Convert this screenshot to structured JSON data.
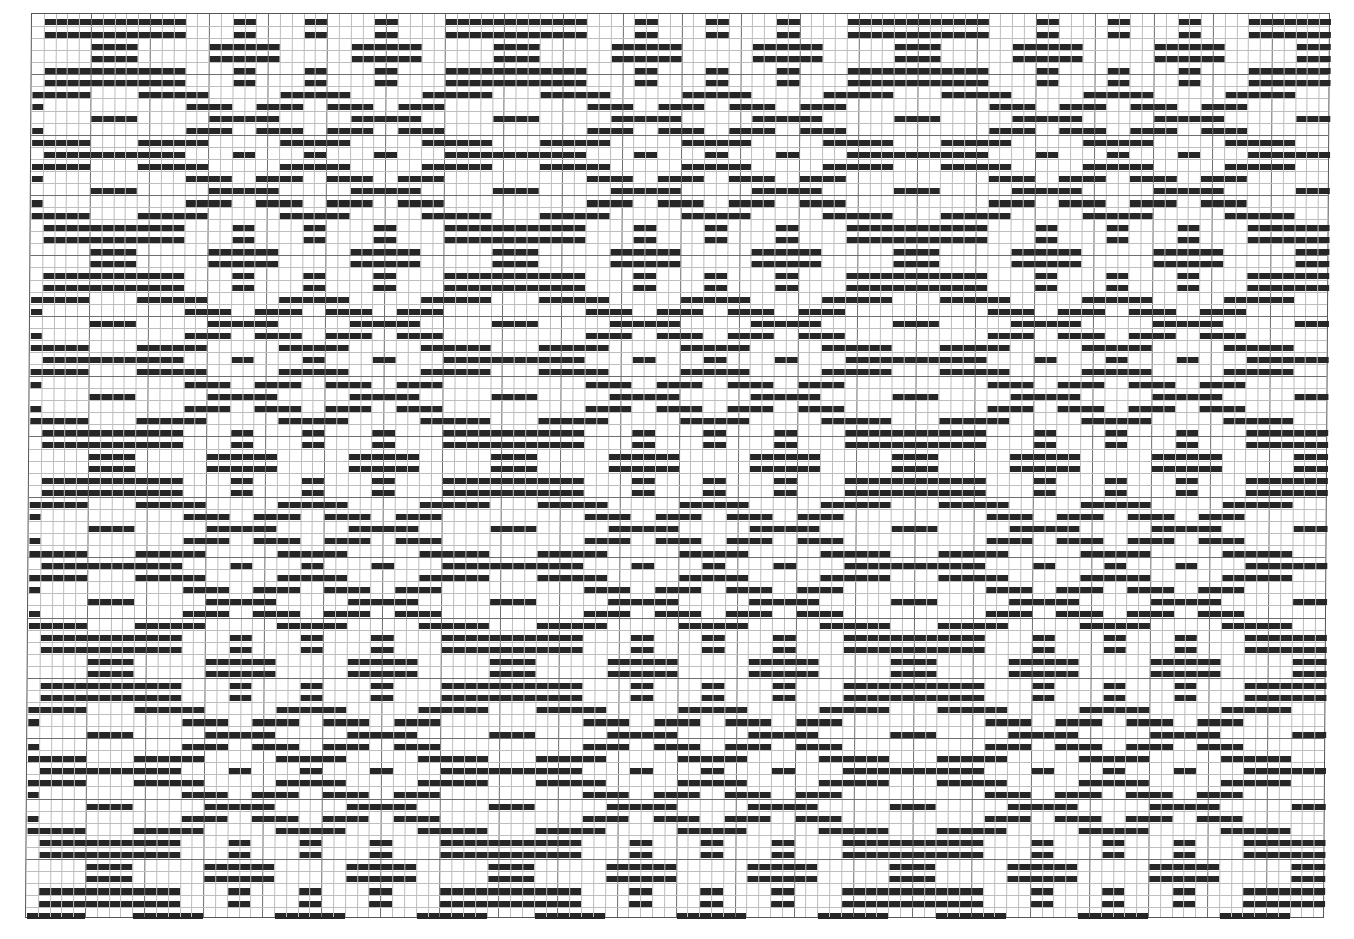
{
  "draft": {
    "type": "overshot-drawdown",
    "columns": 110,
    "rows": 75,
    "cell_width": 11.81,
    "cell_height": 12.07,
    "major_every": 5,
    "colors": {
      "float": "#262626",
      "background": "#ffffff",
      "grid_minor": "#bdbdbd",
      "grid_major": "#6e6e6e",
      "border": "#555555"
    },
    "threading_runs": [
      [
        0,
        2
      ],
      [
        1,
        2
      ],
      [
        2,
        4
      ],
      [
        3,
        4
      ],
      [
        2,
        4
      ],
      [
        1,
        2
      ],
      [
        0,
        2
      ],
      [
        3,
        2
      ],
      [
        0,
        2
      ],
      [
        1,
        2
      ],
      [
        2,
        2
      ],
      [
        1,
        2
      ],
      [
        0,
        2
      ],
      [
        3,
        2
      ]
    ],
    "threading_offset": 3,
    "treadling_runs": [
      [
        0,
        1
      ],
      [
        1,
        1
      ],
      [
        2,
        2
      ],
      [
        3,
        2
      ],
      [
        2,
        2
      ],
      [
        1,
        1
      ],
      [
        0,
        1
      ],
      [
        3,
        1
      ],
      [
        0,
        1
      ],
      [
        1,
        1
      ],
      [
        2,
        1
      ],
      [
        1,
        1
      ],
      [
        0,
        1
      ],
      [
        3,
        1
      ]
    ],
    "treadling_offset": 2
  }
}
